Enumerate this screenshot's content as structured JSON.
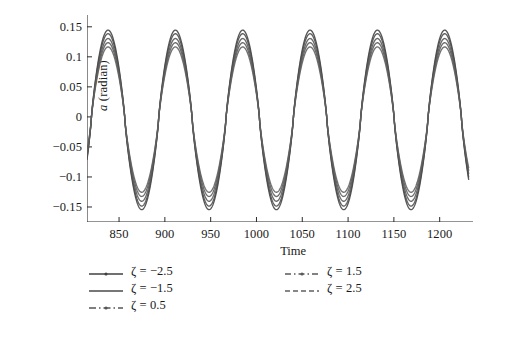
{
  "chart_data": {
    "type": "line",
    "title": "",
    "subtitle": "",
    "xlabel": "Time",
    "ylabel": "a (radian)",
    "ylabel_italic_part": "a",
    "ylabel_rest": " (radian)",
    "xlim": [
      815,
      1232
    ],
    "ylim": [
      -0.175,
      0.168
    ],
    "xticks": [
      850,
      900,
      950,
      1000,
      1050,
      1100,
      1150,
      1200
    ],
    "xtick_labels": [
      "850",
      "900",
      "950",
      "1000",
      "1050",
      "1100",
      "1150",
      "1200"
    ],
    "yticks": [
      -0.15,
      -0.1,
      -0.05,
      0,
      0.05,
      0.1,
      0.15
    ],
    "ytick_labels": [
      "−0.15",
      "−0.1",
      "−0.05",
      "0",
      "0.05",
      "0.1",
      "0.15"
    ],
    "grid": false,
    "legend_position": "below-plot-two-columns",
    "axis_style": "left-and-bottom-spines",
    "line_color": "#4a4a4a",
    "waveform": {
      "description": "damped-free steady oscillation, slightly peaked sinusoid",
      "period": 73.5,
      "first_peak_time": 838.0,
      "peak_count": 6,
      "shape_exponent": 1.18
    },
    "series": [
      {
        "name": "ζ = −2.5",
        "zeta": -2.5,
        "label": "ζ = −2.5",
        "legend_style": "solid-with-dot",
        "peak_amplitude": 0.1445,
        "trough_amplitude": -0.1545,
        "phase_offset": 0.0,
        "color": "#404040"
      },
      {
        "name": "ζ = −1.5",
        "zeta": -1.5,
        "label": "ζ = −1.5",
        "legend_style": "solid",
        "peak_amplitude": 0.1385,
        "trough_amplitude": -0.1485,
        "phase_offset": 0.0,
        "color": "#4a4a4a"
      },
      {
        "name": "ζ = 0.5",
        "zeta": 0.5,
        "label": "ζ = 0.5",
        "legend_style": "dash-dot",
        "peak_amplitude": 0.1305,
        "trough_amplitude": -0.1405,
        "phase_offset": 0.0,
        "color": "#555555"
      },
      {
        "name": "ζ = 1.5",
        "zeta": 1.5,
        "label": "ζ = 1.5",
        "legend_style": "dash-dot-dash",
        "peak_amplitude": 0.1235,
        "trough_amplitude": -0.1325,
        "phase_offset": 0.0,
        "color": "#5a5a5a"
      },
      {
        "name": "ζ = 2.5",
        "zeta": 2.5,
        "label": "ζ = 2.5",
        "legend_style": "dashed",
        "peak_amplitude": 0.1165,
        "trough_amplitude": -0.1255,
        "phase_offset": 0.0,
        "color": "#606060"
      }
    ]
  },
  "legend": {
    "left_column": [
      "ζ = −2.5",
      "ζ = −1.5",
      "ζ = 0.5"
    ],
    "right_column": [
      "ζ = 1.5",
      "ζ = 2.5"
    ]
  }
}
